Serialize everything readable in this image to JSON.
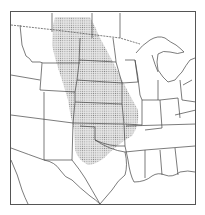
{
  "map": {
    "title": "",
    "region_depicted": "Central United States",
    "highlighted_region": {
      "name": "stippled-region",
      "fill_pattern": "dots",
      "color": "#9a9a9a"
    },
    "colors": {
      "background": "#ffffff",
      "border": "#333333",
      "state_lines": "#444444",
      "frame": "#555555"
    },
    "labels": []
  }
}
